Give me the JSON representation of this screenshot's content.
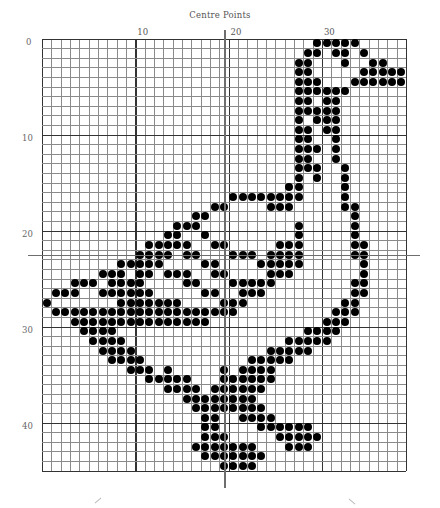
{
  "title": "Centre Points",
  "grid": {
    "columns": 39,
    "rows": 45,
    "cell_width": 9.33,
    "cell_height": 9.6,
    "major_every": 10,
    "line_color": "#8a8a8a",
    "major_line_color": "#333333",
    "dot_color": "#000000"
  },
  "column_labels": [
    {
      "text": "10",
      "col": 10
    },
    {
      "text": "20",
      "col": 20
    },
    {
      "text": "30",
      "col": 30
    }
  ],
  "row_labels": [
    {
      "text": "0",
      "row": 0
    },
    {
      "text": "10",
      "row": 10
    },
    {
      "text": "20",
      "row": 20
    },
    {
      "text": "30",
      "row": 30
    },
    {
      "text": "40",
      "row": 40
    }
  ],
  "centre_lines": {
    "horizontal_y": 255,
    "vertical_x": 224
  },
  "filled_cells": [
    [
      29,
      30,
      31,
      32,
      33
    ],
    [
      28,
      29,
      31,
      32,
      34
    ],
    [
      27,
      28,
      32,
      35,
      36
    ],
    [
      27,
      28,
      34,
      35,
      36,
      37,
      38
    ],
    [
      27,
      28,
      29,
      33,
      34,
      35,
      36,
      37,
      38
    ],
    [
      27,
      28,
      29,
      30,
      31,
      32
    ],
    [
      27,
      28,
      30,
      31
    ],
    [
      27,
      28,
      29,
      30,
      31
    ],
    [
      27,
      29,
      30,
      31
    ],
    [
      27,
      28,
      30,
      31
    ],
    [
      27,
      28,
      31
    ],
    [
      27,
      28,
      29,
      31
    ],
    [
      27,
      28,
      31
    ],
    [
      27,
      28,
      29,
      32
    ],
    [
      27,
      29,
      32
    ],
    [
      26,
      27,
      32
    ],
    [
      20,
      21,
      22,
      23,
      24,
      25,
      26,
      27,
      32
    ],
    [
      18,
      19,
      24,
      25,
      26,
      32,
      33
    ],
    [
      16,
      17,
      33
    ],
    [
      14,
      15,
      16,
      27,
      33
    ],
    [
      13,
      14,
      17,
      27,
      33
    ],
    [
      11,
      12,
      13,
      14,
      15,
      18,
      19,
      25,
      26,
      27,
      33,
      34
    ],
    [
      10,
      11,
      12,
      13,
      15,
      16,
      20,
      21,
      22,
      24,
      25,
      26,
      27,
      33,
      34
    ],
    [
      8,
      9,
      10,
      11,
      12,
      17,
      18,
      23,
      24,
      25,
      26,
      27,
      34
    ],
    [
      6,
      7,
      8,
      10,
      11,
      13,
      14,
      15,
      18,
      19,
      24,
      25,
      26,
      34
    ],
    [
      3,
      4,
      5,
      7,
      8,
      9,
      10,
      15,
      16,
      20,
      21,
      22,
      23,
      24,
      33,
      34
    ],
    [
      1,
      2,
      3,
      6,
      7,
      8,
      9,
      10,
      11,
      17,
      18,
      21,
      22,
      23,
      33,
      34
    ],
    [
      0,
      8,
      9,
      10,
      11,
      12,
      13,
      14,
      19,
      20,
      21,
      32,
      33
    ],
    [
      1,
      2,
      3,
      4,
      5,
      6,
      7,
      8,
      9,
      10,
      11,
      12,
      13,
      14,
      15,
      16,
      17,
      18,
      19,
      20,
      31,
      32,
      33
    ],
    [
      3,
      4,
      5,
      6,
      7,
      8,
      9,
      10,
      11,
      12,
      13,
      14,
      15,
      16,
      17,
      30,
      31,
      32
    ],
    [
      4,
      5,
      6,
      7,
      28,
      29,
      30,
      31
    ],
    [
      5,
      6,
      7,
      8,
      26,
      27,
      28,
      29,
      30
    ],
    [
      6,
      7,
      8,
      9,
      24,
      25,
      26,
      27,
      28
    ],
    [
      7,
      8,
      9,
      10,
      22,
      23,
      24,
      25,
      26
    ],
    [
      9,
      10,
      11,
      13,
      19,
      21,
      22,
      23,
      24
    ],
    [
      11,
      12,
      13,
      14,
      15,
      19,
      20,
      21,
      22,
      23,
      24
    ],
    [
      13,
      14,
      15,
      16,
      18,
      19,
      20,
      21,
      22,
      23
    ],
    [
      15,
      16,
      17,
      18,
      19,
      20,
      21,
      22
    ],
    [
      16,
      17,
      18,
      19,
      20,
      21,
      22,
      23
    ],
    [
      17,
      18,
      21,
      22,
      23,
      24
    ],
    [
      17,
      18,
      23,
      24,
      25,
      26,
      27,
      28
    ],
    [
      17,
      18,
      19,
      25,
      26,
      27,
      28,
      29
    ],
    [
      16,
      17,
      18,
      19,
      20,
      21,
      22,
      26,
      27,
      28
    ],
    [
      17,
      18,
      19,
      20,
      21,
      22,
      23
    ],
    [
      19,
      20,
      21,
      22
    ]
  ]
}
